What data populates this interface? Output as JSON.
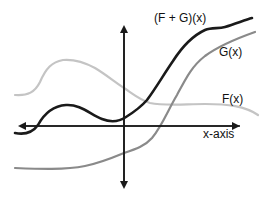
{
  "diagram": {
    "title": "",
    "labels": {
      "sum_curve": "(F + G)(x)",
      "g_curve": "G(x)",
      "f_curve": "F(x)",
      "x_axis": "x-axis"
    },
    "colors": {
      "axis": "#1a1a1a",
      "sum_curve": "#1a1a1a",
      "g_curve": "#8a8a8a",
      "f_curve": "#c4c4c4",
      "background": "#ffffff"
    },
    "curves": [
      {
        "name": "F(x)",
        "description": "light gray curve rising to a hump on the left, then descending and flattening to the right"
      },
      {
        "name": "G(x)",
        "description": "medium gray curve flat and low on the left, rising steeply past the y-axis"
      },
      {
        "name": "(F + G)(x)",
        "description": "black sum curve with a small hump on the left, dipping near the y-axis, then rising steeply"
      }
    ]
  }
}
